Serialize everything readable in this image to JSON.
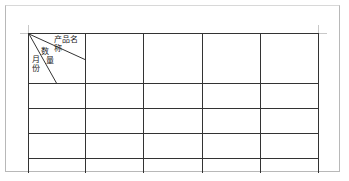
{
  "document": {
    "table": {
      "header_cell": {
        "product_label": "产品名称",
        "quantity_label_1": "数",
        "quantity_label_2": "量",
        "month_label_1": "月",
        "month_label_2": "份"
      },
      "column_widths": [
        57,
        58,
        59,
        58,
        58
      ],
      "row_heights": [
        50,
        25,
        25,
        25,
        14
      ],
      "rows": [
        [
          "",
          "",
          "",
          "",
          ""
        ],
        [
          "",
          "",
          "",
          "",
          ""
        ],
        [
          "",
          "",
          "",
          "",
          ""
        ],
        [
          "",
          "",
          "",
          "",
          ""
        ],
        [
          "",
          "",
          "",
          "",
          ""
        ]
      ]
    }
  }
}
